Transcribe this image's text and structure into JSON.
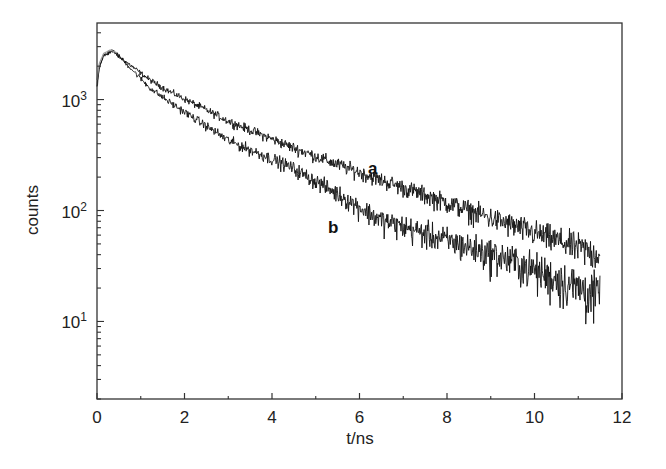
{
  "chart_data": {
    "type": "line",
    "title": "",
    "xlabel": "t/ns",
    "ylabel": "counts",
    "xscale": "linear",
    "yscale": "log",
    "xlim": [
      0,
      12
    ],
    "ylim": [
      2,
      4900
    ],
    "grid": false,
    "legend": "none (inline labels a, b)",
    "x_ticks": [
      0,
      2,
      4,
      6,
      8,
      10,
      12
    ],
    "x_tick_labels": [
      "0",
      "2",
      "4",
      "6",
      "8",
      "10",
      "12"
    ],
    "y_ticks": [
      10,
      100,
      1000
    ],
    "y_tick_labels": [
      {
        "base": "10",
        "exp": "1"
      },
      {
        "base": "10",
        "exp": "2"
      },
      {
        "base": "10",
        "exp": "3"
      }
    ],
    "annotations": [
      {
        "text": "a",
        "x": 6.3,
        "y": 215
      },
      {
        "text": "b",
        "x": 5.4,
        "y": 63
      }
    ],
    "series": [
      {
        "name": "a",
        "color": "#111111",
        "x": [
          0.0,
          0.05,
          0.15,
          0.35,
          0.53,
          1.2,
          1.67,
          3.04,
          4.4,
          5.33,
          6.47,
          9.44,
          11.5
        ],
        "y": [
          1300,
          1900,
          2500,
          2750,
          2400,
          1510,
          1175,
          630,
          380,
          275,
          190,
          75,
          40
        ]
      },
      {
        "name": "b",
        "color": "#111111",
        "x": [
          0.0,
          0.05,
          0.15,
          0.35,
          0.53,
          1.2,
          1.67,
          3.04,
          4.4,
          5.33,
          6.47,
          9.44,
          11.5
        ],
        "y": [
          1300,
          1900,
          2500,
          2750,
          2400,
          1280,
          940,
          420,
          250,
          155,
          83,
          36,
          17
        ]
      },
      {
        "name": "instrument-response / fit",
        "color": "#9a9a9a",
        "x": [
          0.0,
          0.05,
          0.15,
          0.3,
          0.45
        ],
        "y": [
          1500,
          2100,
          2600,
          2800,
          2650
        ]
      }
    ]
  },
  "axes": {
    "xlabel": "t/ns",
    "ylabel": "counts"
  }
}
